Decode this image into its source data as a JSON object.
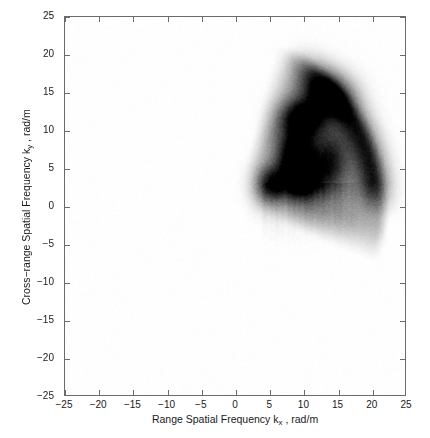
{
  "figure": {
    "background_color": "#ffffff",
    "axes_color": "#6b6b6b",
    "text_color": "#1a1a1a"
  },
  "axes": {
    "xlabel_prefix": "Range Spatial Frequency k",
    "xlabel_sub": "x",
    "xlabel_suffix": " , rad/m",
    "ylabel_prefix": "Cross−range Spatial Frequency k",
    "ylabel_sub": "y",
    "ylabel_suffix": " , rad/m",
    "xticklabels": [
      "−25",
      "−20",
      "−15",
      "−10",
      "−5",
      "0",
      "5",
      "10",
      "15",
      "20",
      "25"
    ],
    "yticklabels": [
      "25",
      "20",
      "15",
      "10",
      "5",
      "0",
      "−5",
      "−10",
      "−15",
      "−20",
      "−25"
    ]
  },
  "chart_data": {
    "type": "heatmap",
    "title": "",
    "xlabel": "Range Spatial Frequency k_x , rad/m",
    "ylabel": "Cross-range Spatial Frequency k_y , rad/m",
    "xlim": [
      -25,
      25
    ],
    "ylim": [
      -25,
      25
    ],
    "xticks": [
      -25,
      -20,
      -15,
      -10,
      -5,
      0,
      5,
      10,
      15,
      20,
      25
    ],
    "yticks": [
      -25,
      -20,
      -15,
      -10,
      -5,
      0,
      5,
      10,
      15,
      20,
      25
    ],
    "grid": false,
    "legend": null,
    "colormap": "gray_reversed",
    "colormap_low_color": "#ffffff",
    "colormap_high_color": "#000000",
    "support_region": {
      "shape": "annular_wedge",
      "radius_inner": 9.0,
      "radius_outer": 22.0,
      "angle_start_deg": -12,
      "angle_end_deg": 66
    },
    "lobes": [
      {
        "name": "primary-core",
        "kx": 9.0,
        "ky": 6.5,
        "sigma_x": 2.0,
        "sigma_y": 2.6,
        "amplitude": 1.0
      },
      {
        "name": "upper-lobe",
        "kx": 10.0,
        "ky": 11.6,
        "sigma_x": 2.2,
        "sigma_y": 1.7,
        "amplitude": 0.85
      },
      {
        "name": "left-lobe",
        "kx": 5.0,
        "ky": 2.8,
        "sigma_x": 1.5,
        "sigma_y": 1.8,
        "amplitude": 0.78
      },
      {
        "name": "right-lobe",
        "kx": 14.0,
        "ky": 6.0,
        "sigma_x": 1.9,
        "sigma_y": 2.8,
        "amplitude": 0.6
      },
      {
        "name": "lower-core",
        "kx": 9.5,
        "ky": 3.0,
        "sigma_x": 2.4,
        "sigma_y": 1.8,
        "amplitude": 0.72
      },
      {
        "name": "arc-shoulder",
        "kx": 13.5,
        "ky": 14.5,
        "sigma_x": 2.6,
        "sigma_y": 2.0,
        "amplitude": 0.55
      }
    ],
    "outer_arc": {
      "radius": 20.6,
      "thickness": 1.6,
      "angle_start_deg": 2,
      "angle_end_deg": 60,
      "amplitude": 0.62
    },
    "streaks": {
      "kx_range": [
        4.0,
        18.0
      ],
      "ky_range": [
        -5.0,
        3.0
      ],
      "amplitude": 0.1
    },
    "data_extent": {
      "kx_min": 1.2,
      "kx_max": 22.0,
      "ky_min": -5.0,
      "ky_max": 18.2
    }
  }
}
